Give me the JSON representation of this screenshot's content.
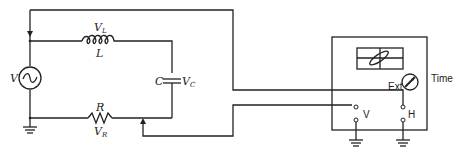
{
  "diagram": {
    "components": {
      "source": {
        "label": "V"
      },
      "inductor": {
        "label": "L",
        "voltage_label": "V",
        "voltage_sub": "L"
      },
      "capacitor": {
        "label": "C",
        "voltage_label": "V",
        "voltage_sub": "C"
      },
      "resistor": {
        "label": "R",
        "voltage_label": "V",
        "voltage_sub": "R"
      }
    },
    "oscilloscope": {
      "ext_label": "Ext",
      "time_label": "Time",
      "v_input_label": "V",
      "h_input_label": "H"
    }
  }
}
